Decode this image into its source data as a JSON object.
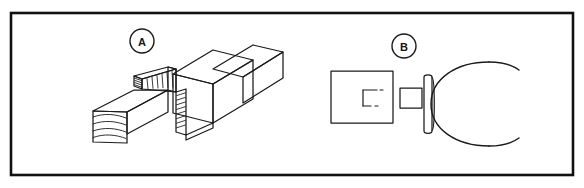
{
  "figure": {
    "type": "technical-line-drawing",
    "background_color": "#ffffff",
    "line_color": "#1a1a1a",
    "border": {
      "name": "figure-border",
      "style": "solid rectangle frame",
      "color": "#111111",
      "stroke_width": 2.6,
      "x": 11,
      "y": 13,
      "width": 562,
      "height": 162
    },
    "panels": [
      {
        "id": "A",
        "label": "A",
        "label_shape": "circle",
        "label_center_x": 142,
        "label_center_y": 41,
        "label_radius": 12,
        "caption": "mortise-and-tenon timber joint, exploded isometric view",
        "parts": [
          "main beam running upper-right to lower-left",
          "open mortise socket with hatched end grain",
          "separate tenon member at lower left with curved end grain"
        ]
      },
      {
        "id": "B",
        "label": "B",
        "label_shape": "circle",
        "label_center_x": 404,
        "label_center_y": 46,
        "label_radius": 12,
        "caption": "peg and C-ring retainer, plan view",
        "parts": [
          "rectangular body with dashed hidden mortise",
          "square peg shaft",
          "rounded collar head",
          "open C-shaped ring"
        ]
      }
    ]
  }
}
